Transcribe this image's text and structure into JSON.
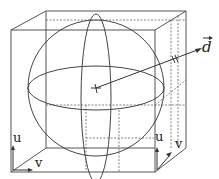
{
  "diagram": {
    "labels": {
      "direction_vector": "d",
      "front_face_u": "u",
      "front_face_v": "v",
      "side_face_u": "u",
      "side_face_v": "v"
    },
    "colors": {
      "line": "#555555",
      "dashed": "#666666",
      "text": "#222222"
    }
  }
}
